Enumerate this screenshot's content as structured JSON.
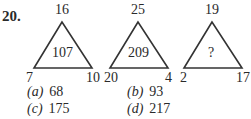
{
  "question": {
    "number": "20.",
    "triangles": [
      {
        "top": "16",
        "left": "7",
        "right": "10",
        "center": "107"
      },
      {
        "top": "25",
        "left": "20",
        "right": "4",
        "center": "209"
      },
      {
        "top": "19",
        "left": "2",
        "right": "17",
        "center": "?"
      }
    ],
    "options": [
      {
        "key": "(a)",
        "value": "68"
      },
      {
        "key": "(b)",
        "value": "93"
      },
      {
        "key": "(c)",
        "value": "175"
      },
      {
        "key": "(d)",
        "value": "217"
      }
    ]
  }
}
